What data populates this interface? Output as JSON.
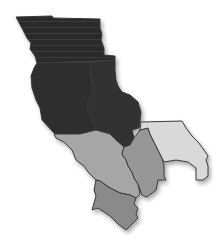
{
  "map": {
    "type": "choropleth-region-map",
    "background": "#ffffff",
    "regions": [
      {
        "id": "north-band",
        "shade": "darkest",
        "color": "#2a2a2a"
      },
      {
        "id": "west-central",
        "shade": "darkest",
        "color": "#2e2e2e"
      },
      {
        "id": "east-central",
        "shade": "darkest",
        "color": "#323232"
      },
      {
        "id": "southwest-large",
        "shade": "medium-light",
        "color": "#a6a6a6"
      },
      {
        "id": "south-middle",
        "shade": "medium",
        "color": "#979797"
      },
      {
        "id": "east-lobe",
        "shade": "light",
        "color": "#d9d9d9"
      },
      {
        "id": "far-south",
        "shade": "medium-dark",
        "color": "#8a8a8a"
      }
    ],
    "border_color": "#3a3a3a"
  }
}
